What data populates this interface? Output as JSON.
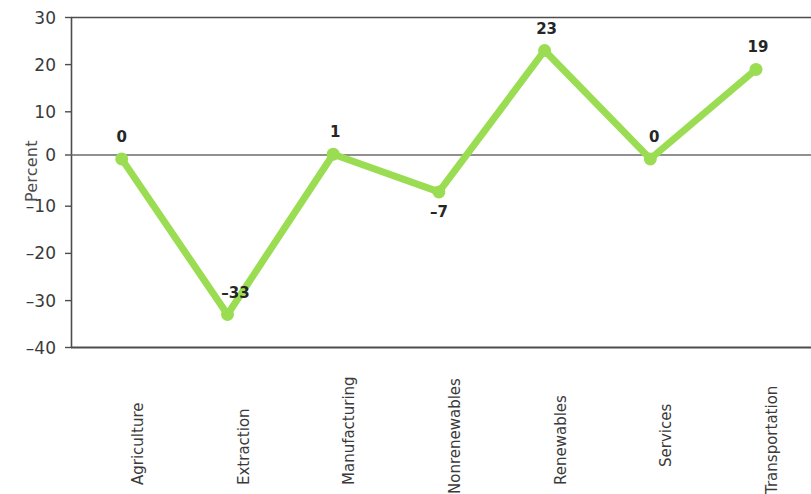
{
  "chart_data": {
    "type": "line",
    "title": "",
    "subtitle": "",
    "xlabel": "",
    "ylabel": "Percent",
    "categories": [
      "Agriculture",
      "Extraction",
      "Manufacturing",
      "Nonrenewables",
      "Renewables",
      "Services",
      "Transportation"
    ],
    "values": [
      0,
      -33,
      1,
      -7,
      23,
      0,
      19
    ],
    "point_labels": [
      "0",
      "–33",
      "1",
      "–7",
      "23",
      "0",
      "19"
    ],
    "ylim": [
      -40,
      30
    ],
    "yticks": [
      30,
      20,
      10,
      0,
      -10,
      -20,
      -30,
      -40
    ],
    "ytick_labels": [
      "30",
      "20",
      "10",
      "0",
      "–10",
      "–20",
      "–30",
      "–40"
    ],
    "grid": false,
    "zero_line": true,
    "legend": null,
    "legend_position": "none",
    "series_color": "#9BDD52",
    "marker": "circle",
    "axis_color": "#4d4d4d",
    "label_color": "#262626"
  }
}
